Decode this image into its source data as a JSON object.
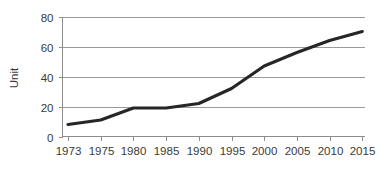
{
  "chart_data": {
    "type": "line",
    "title": "",
    "xlabel": "",
    "ylabel": "Unit",
    "x": [
      1973,
      1975,
      1980,
      1985,
      1990,
      1995,
      2000,
      2005,
      2010,
      2015
    ],
    "categories": [
      "1973",
      "1975",
      "1980",
      "1985",
      "1990",
      "1995",
      "2000",
      "2005",
      "2010",
      "2015"
    ],
    "values": [
      8,
      11,
      19,
      19,
      22,
      32,
      47,
      56,
      64,
      70
    ],
    "series": [
      {
        "name": "Unit",
        "values": [
          8,
          11,
          19,
          19,
          22,
          32,
          47,
          56,
          64,
          70
        ],
        "color": "#262626"
      }
    ],
    "ylim": [
      0,
      80
    ],
    "yticks": [
      0,
      20,
      40,
      60,
      80
    ],
    "ytick_labels": [
      "0",
      "20",
      "40",
      "60",
      "80"
    ],
    "grid": true,
    "grid_axis": "y",
    "legend": false,
    "legend_position": "none",
    "markers": false,
    "line_color": "#262626",
    "grid_color": "#9a9a9a",
    "axis_color": "#8d8d8d",
    "background": "#ffffff"
  },
  "axes": {
    "y_title": "Unit"
  }
}
